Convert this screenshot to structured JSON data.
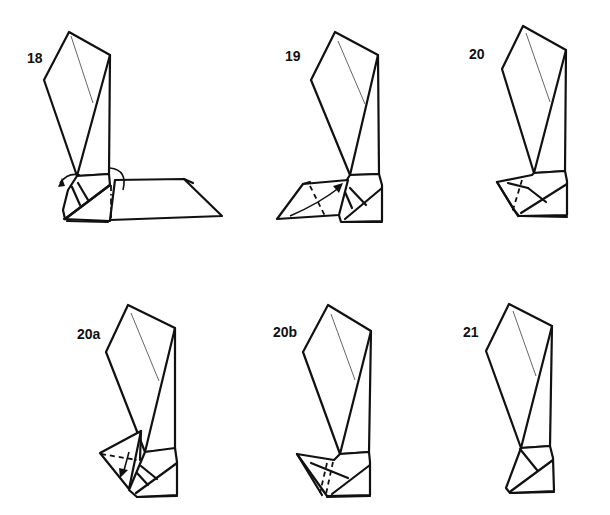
{
  "diagram": {
    "type": "origami-folding-instructions",
    "steps": [
      {
        "label": "18",
        "description": "crease shown with dash-dot valley line, rotate arrows on both sides of model"
      },
      {
        "label": "19",
        "description": "valley fold dashed line, fold flap up along curved arrow"
      },
      {
        "label": "20",
        "description": "flap folded into base pocket"
      },
      {
        "label": "20a",
        "description": "triangular flap with dashed valley line and down arrow"
      },
      {
        "label": "20b",
        "description": "flap tucked into base"
      },
      {
        "label": "21",
        "description": "finished leg/foot shape"
      }
    ],
    "colors": {
      "line": "#111111",
      "background": "#ffffff",
      "crease": "#555555"
    }
  }
}
